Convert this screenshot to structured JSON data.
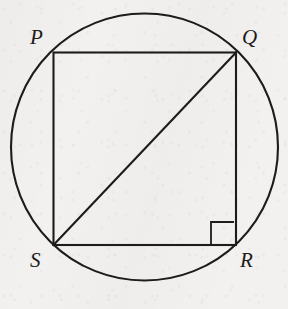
{
  "figure": {
    "kind": "geometry-diagram",
    "background_color": "#f2f1ef",
    "stroke_color": "#1c1c1c",
    "fill_color": "none"
  },
  "circle": {
    "name": "circumscribed-circle",
    "center_x": 144.5,
    "center_y": 147,
    "radius": 133.5,
    "stroke_width": 2.1
  },
  "square": {
    "name": "square-pqrs",
    "left": 53.5,
    "top": 52.5,
    "right": 236,
    "bottom": 245,
    "stroke_width": 2.1
  },
  "diagonal": {
    "name": "diagonal-sq",
    "from": "S",
    "to": "Q",
    "x1": 53.5,
    "y1": 245,
    "x2": 236,
    "y2": 52.5,
    "stroke_width": 2.1
  },
  "right_angle_mark": {
    "name": "right-angle-mark-r",
    "at_vertex": "R",
    "x": 211,
    "y": 222,
    "size": 23,
    "stroke_width": 1.8
  },
  "vertices": [
    {
      "id": "P",
      "label": "P",
      "point_x": 53.5,
      "point_y": 52.5,
      "label_x": 30,
      "label_y": 27,
      "position": "top-left"
    },
    {
      "id": "Q",
      "label": "Q",
      "point_x": 236,
      "point_y": 52.5,
      "label_x": 242,
      "label_y": 27,
      "position": "top-right"
    },
    {
      "id": "R",
      "label": "R",
      "point_x": 236,
      "point_y": 245,
      "label_x": 240,
      "label_y": 250,
      "position": "bottom-right"
    },
    {
      "id": "S",
      "label": "S",
      "point_x": 53.5,
      "point_y": 245,
      "label_x": 30,
      "label_y": 250,
      "position": "bottom-left"
    }
  ]
}
